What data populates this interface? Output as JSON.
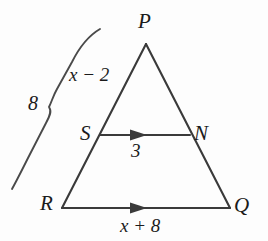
{
  "figure": {
    "kind": "geometry-diagram",
    "background_color": "#fdfdfd",
    "stroke_color": "#3a3a3a",
    "text_color": "#1b1b1b",
    "vertices": {
      "P": {
        "label": "P",
        "x": 146,
        "y": 42
      },
      "R": {
        "label": "R",
        "x": 62,
        "y": 208
      },
      "Q": {
        "label": "Q",
        "x": 230,
        "y": 208
      },
      "S": {
        "label": "S",
        "x": 100,
        "y": 135
      },
      "N": {
        "label": "N",
        "x": 190,
        "y": 135
      }
    },
    "segments": [
      {
        "name": "PR",
        "from": "P",
        "to": "R",
        "marks": 0
      },
      {
        "name": "PQ",
        "from": "P",
        "to": "Q",
        "marks": 0
      },
      {
        "name": "RQ",
        "from": "R",
        "to": "Q",
        "marks": 1,
        "measure": "x + 8"
      },
      {
        "name": "SN",
        "from": "S",
        "to": "N",
        "marks": 1,
        "measure": "3"
      }
    ],
    "measures": {
      "ps_label": "x − 2",
      "sr_label": "8",
      "sn_label": "3",
      "rq_label": "x + 8"
    },
    "brace": {
      "name": "brace-sr",
      "label": "8",
      "spans": "SR portion of side PR"
    }
  }
}
